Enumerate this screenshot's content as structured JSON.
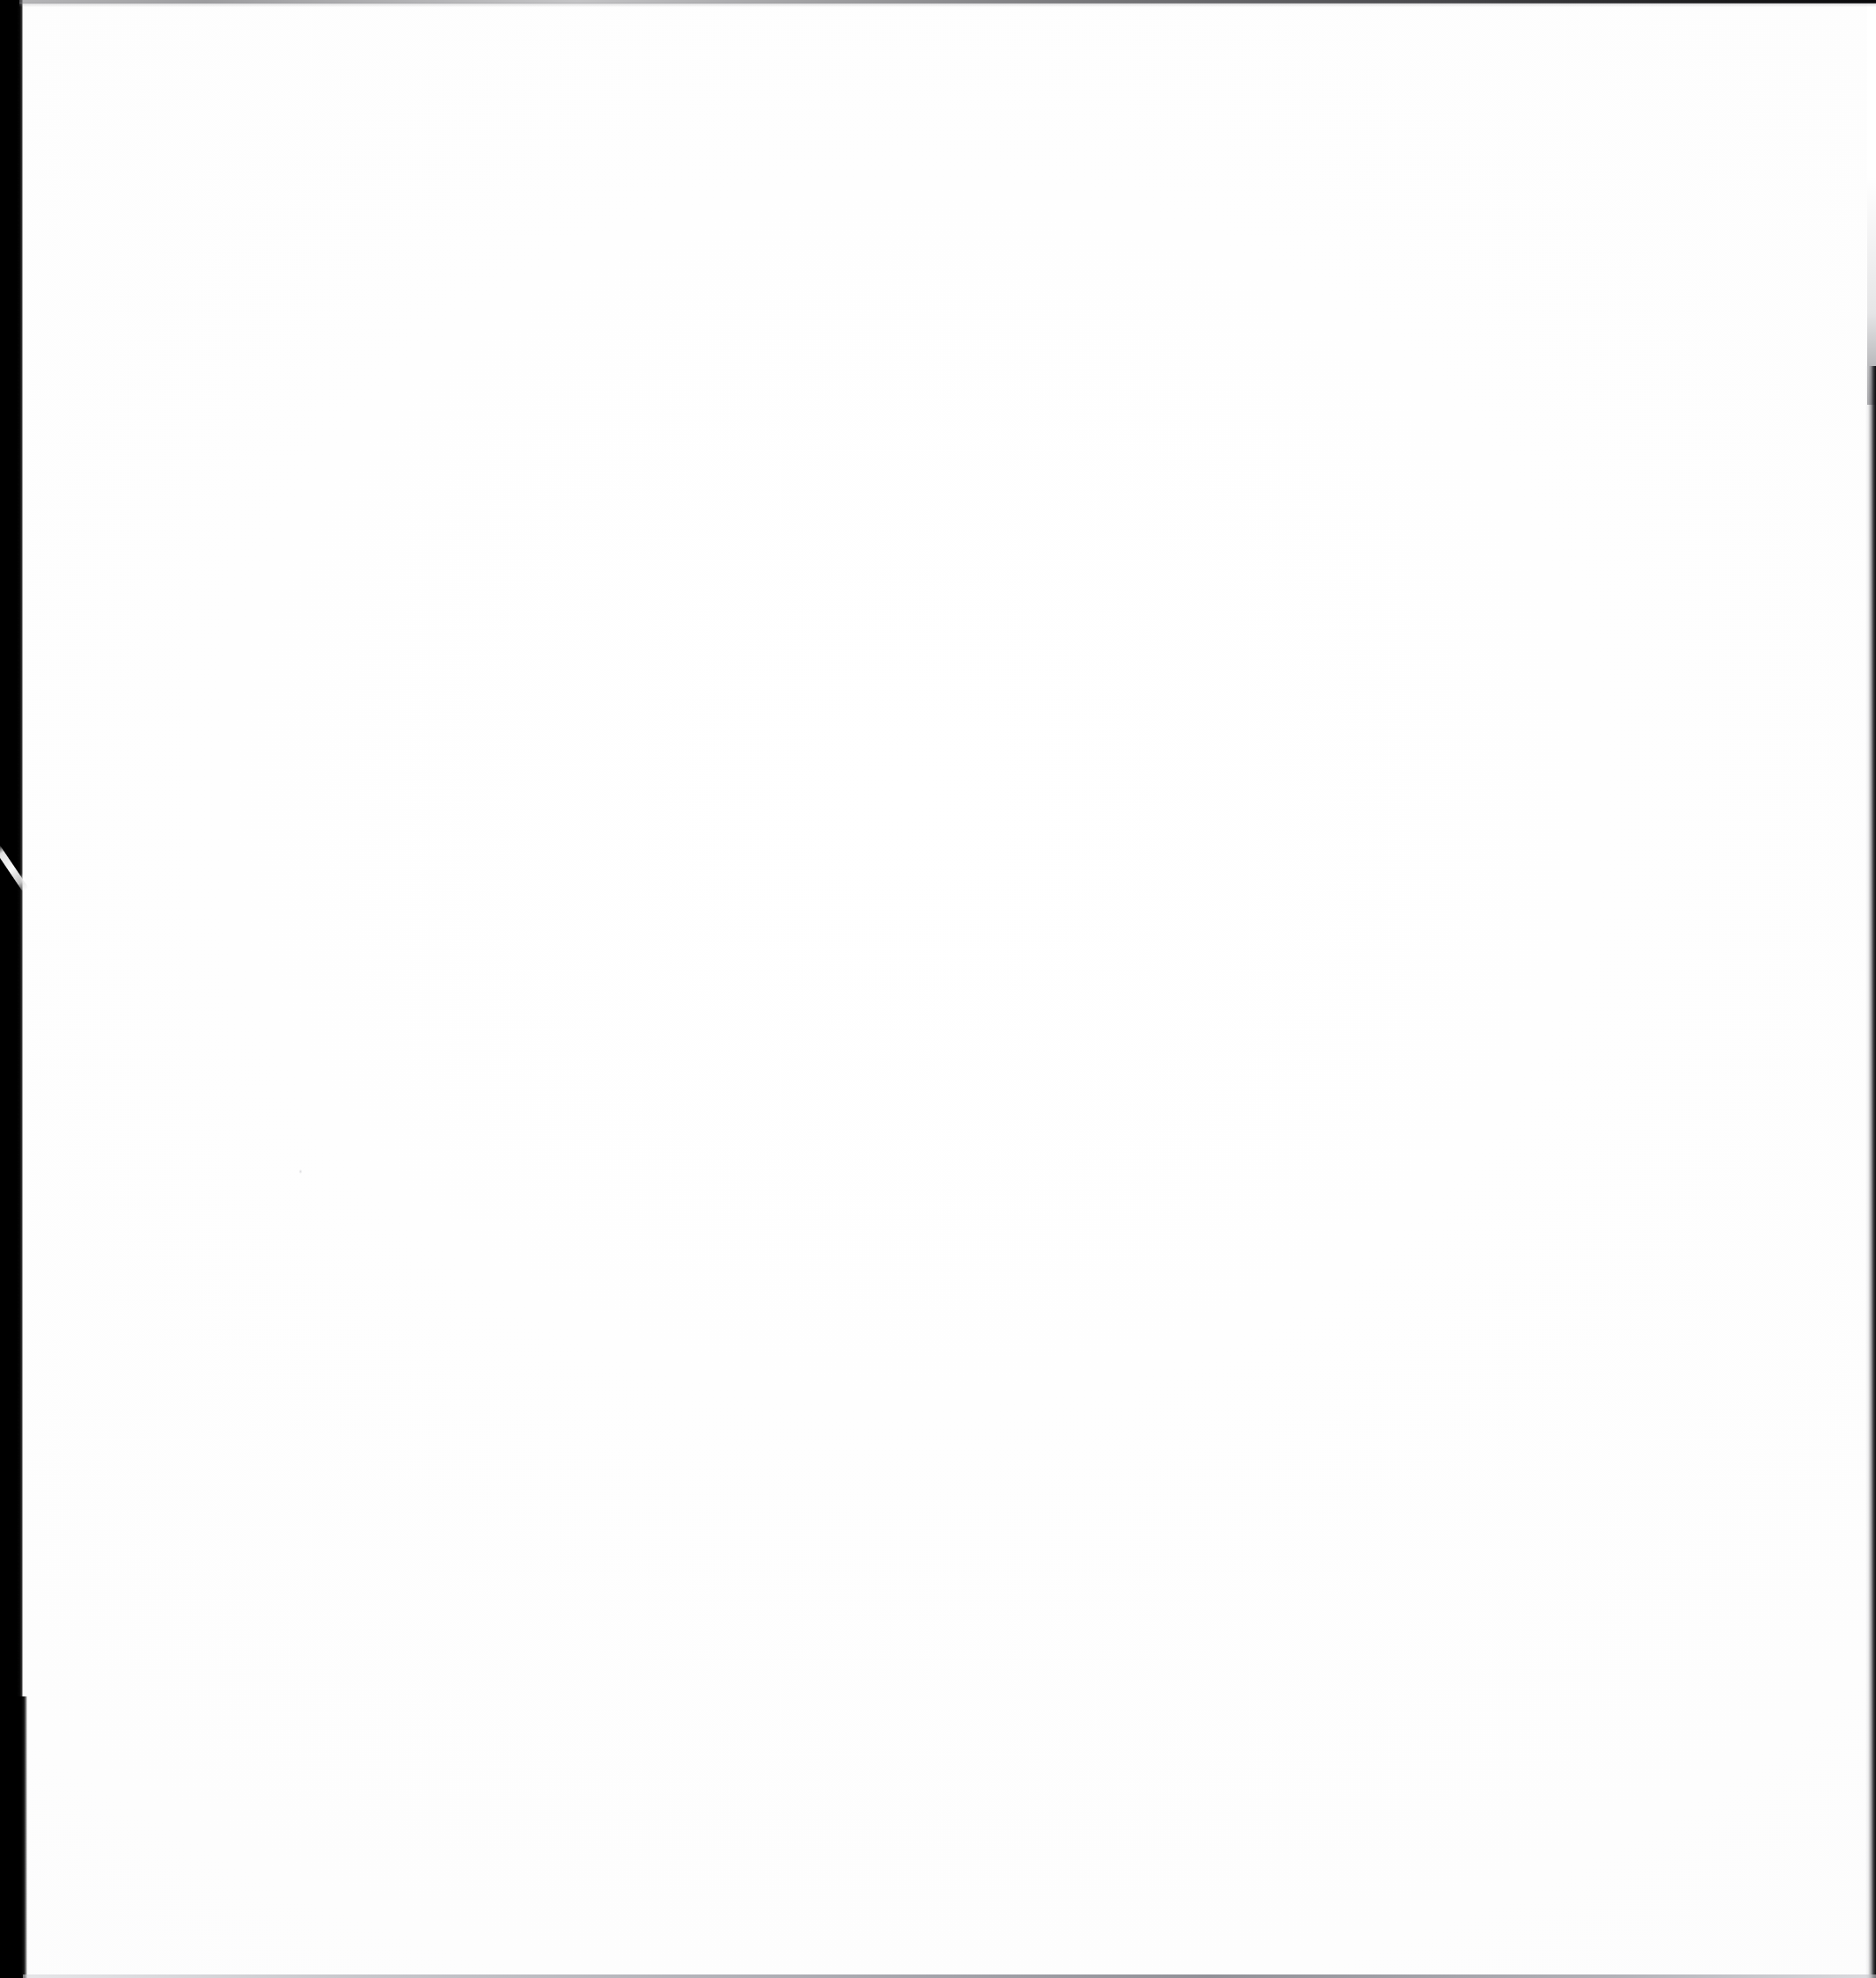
{
  "document": {
    "kind": "scanned-page",
    "content_state": "blank",
    "page_text": "",
    "width_px": 2132,
    "height_px": 2248
  },
  "colors": {
    "paper": "#ffffff",
    "gutter_black": "#000000",
    "edge_top_dark": "#08080a",
    "edge_right_dark": "#0a0a0c",
    "edge_bottom_grey": "#787880",
    "scratch_white": "#fcfcfc",
    "speck_grey": "#c4c4c8"
  },
  "artifacts": {
    "gutter": {
      "name": "left-binding-shadow",
      "x": 0,
      "y": 0,
      "width": 26,
      "height": 2248
    },
    "scratch": {
      "name": "white-diagonal-scratch",
      "x": 0,
      "y": 958,
      "width": 32,
      "height": 47
    },
    "edge_top": {
      "name": "top-scan-boundary",
      "x": 22,
      "y": 0,
      "width": 2110,
      "height": 4
    },
    "edge_right": {
      "name": "right-scan-boundary",
      "x": 2120,
      "y": 416,
      "width": 12,
      "height": 1832
    },
    "edge_bottom": {
      "name": "bottom-scan-boundary",
      "x": 26,
      "y": 2244,
      "width": 2106,
      "height": 4
    },
    "speck": {
      "name": "paper-speck",
      "x": 339,
      "y": 1328,
      "width": 5,
      "height": 7
    }
  }
}
